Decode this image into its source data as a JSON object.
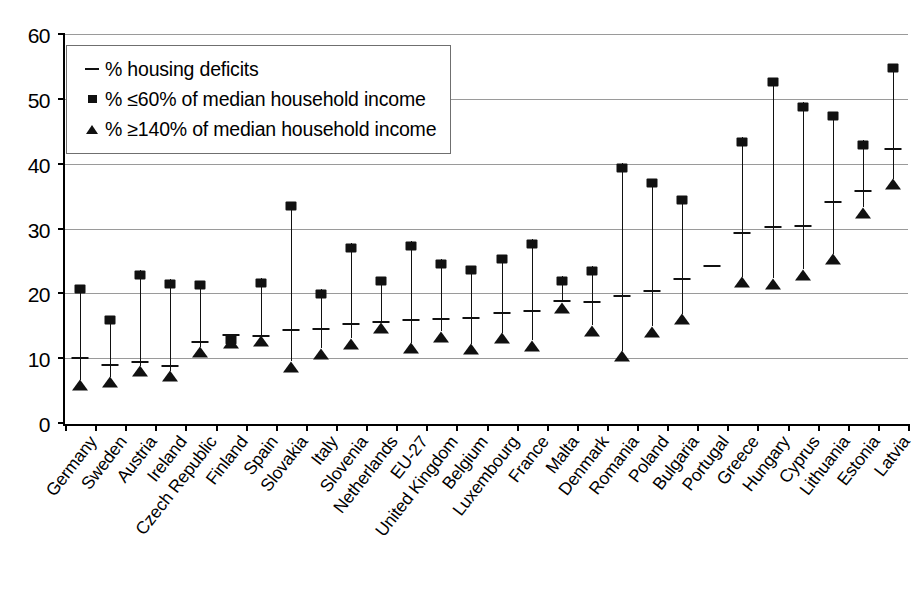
{
  "chart_data": {
    "type": "scatter",
    "title": "",
    "xlabel": "",
    "ylabel": "",
    "ylim": [
      0,
      60
    ],
    "y_ticks": [
      0,
      10,
      20,
      30,
      40,
      50,
      60
    ],
    "grid": true,
    "legend_position": "top-left",
    "categories": [
      "Germany",
      "Sweden",
      "Austria",
      "Ireland",
      "Czech Republic",
      "Finland",
      "Spain",
      "Slovakia",
      "Italy",
      "Slovenia",
      "Netherlands",
      "EU-27",
      "United Kingdom",
      "Belgium",
      "Luxembourg",
      "France",
      "Malta",
      "Denmark",
      "Romania",
      "Poland",
      "Bulgaria",
      "Portugal",
      "Greece",
      "Hungary",
      "Cyprus",
      "Lithuania",
      "Estonia",
      "Latvia"
    ],
    "series": [
      {
        "name": "% housing deficits",
        "marker": "dash",
        "values": [
          10.2,
          9.1,
          9.6,
          9.0,
          12.7,
          13.7,
          13.5,
          14.5,
          14.6,
          15.5,
          15.8,
          16.0,
          16.2,
          16.4,
          17.2,
          17.4,
          19.0,
          18.8,
          19.8,
          20.5,
          22.4,
          24.4,
          29.4,
          30.4,
          30.5,
          34.3,
          36.0,
          42.4
        ]
      },
      {
        "name": "% ≤60% of median household income",
        "marker": "square",
        "values": [
          21.5,
          16.7,
          23.7,
          22.3,
          22.1,
          13.6,
          22.5,
          34.3,
          20.8,
          27.9,
          22.7,
          28.2,
          25.4,
          24.4,
          26.1,
          28.5,
          22.8,
          24.3,
          40.2,
          37.8,
          35.2,
          null,
          44.2,
          53.4,
          49.6,
          48.2,
          43.8,
          55.6
        ]
      },
      {
        "name": "% ≥140% of median household income",
        "marker": "triangle",
        "values": [
          6.8,
          7.3,
          9.0,
          8.2,
          11.9,
          13.4,
          13.6,
          9.7,
          11.7,
          13.2,
          15.6,
          12.5,
          14.3,
          12.4,
          14.1,
          12.9,
          18.8,
          15.2,
          11.3,
          15.1,
          17.0,
          null,
          22.7,
          22.5,
          23.9,
          26.3,
          33.4,
          37.8
        ]
      }
    ]
  },
  "legend": {
    "entries": [
      {
        "key": "dash-key",
        "label": "% housing deficits"
      },
      {
        "key": "square-key",
        "label": "% ≤60% of median household income"
      },
      {
        "key": "triangle-key",
        "label": "% ≥140% of median household income"
      }
    ]
  }
}
